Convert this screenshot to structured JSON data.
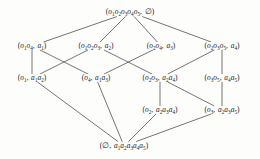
{
  "figure": {
    "type": "hasse-diagram",
    "name": "concept-lattice",
    "width": 260,
    "height": 159,
    "background_color": "#fdfdfc",
    "line_color": "#3a3a3a",
    "text_color": "#1b1b1b"
  },
  "nodes": [
    {
      "id": "top",
      "level": 0,
      "x": 130,
      "y": 12,
      "extent": "o1o2o3o4o5",
      "intent": "",
      "label": "(o1o2o3o4o5, ∅)",
      "html": "<span class=\"paren\">(</span>o<sub>1</sub>o<sub>2</sub>o<sub>3</sub>o<sub>4</sub>o<sub>5</sub><span class=\"comma\">,</span> <span class=\"empty\">∅</span><span class=\"paren\">)</span>"
    },
    {
      "id": "n11",
      "level": 1,
      "x": 32,
      "y": 46,
      "extent": "o1o4",
      "intent": "a1",
      "label": "(o1o4, a1)",
      "html": "<span class=\"paren\">(</span>o<sub>1</sub>o<sub>4</sub><span class=\"comma\">,</span> a<sub>1</sub><span class=\"paren\">)</span>"
    },
    {
      "id": "n12",
      "level": 1,
      "x": 96,
      "y": 46,
      "extent": "o1o2o3",
      "intent": "a2",
      "label": "(o1o2o3, a2)",
      "html": "<span class=\"paren\">(</span>o<sub>1</sub>o<sub>2</sub>o<sub>3</sub><span class=\"comma\">,</span> a<sub>2</sub><span class=\"paren\">)</span>"
    },
    {
      "id": "n13",
      "level": 1,
      "x": 161,
      "y": 46,
      "extent": "o2o4",
      "intent": "a3",
      "label": "(o2o4, a3)",
      "html": "<span class=\"paren\">(</span>o<sub>2</sub>o<sub>4</sub><span class=\"comma\">,</span> a<sub>3</sub><span class=\"paren\">)</span>"
    },
    {
      "id": "n14",
      "level": 1,
      "x": 222,
      "y": 46,
      "extent": "o2o3o5",
      "intent": "a4",
      "label": "(o2o3o5, a4)",
      "html": "<span class=\"paren\">(</span>o<sub>2</sub>o<sub>3</sub>o<sub>5</sub><span class=\"comma\">,</span> a<sub>4</sub><span class=\"paren\">)</span>"
    },
    {
      "id": "n21",
      "level": 2,
      "x": 32,
      "y": 78,
      "extent": "o1",
      "intent": "a1a2",
      "label": "(o1, a1a2)",
      "html": "<span class=\"paren\">(</span>o<sub>1</sub><span class=\"comma\">,</span> a<sub>1</sub>a<sub>2</sub><span class=\"paren\">)</span>"
    },
    {
      "id": "n22",
      "level": 2,
      "x": 96,
      "y": 78,
      "extent": "o4",
      "intent": "a1a3",
      "label": "(o4, a1a3)",
      "html": "<span class=\"paren\">(</span>o<sub>4</sub><span class=\"comma\">,</span> a<sub>1</sub>a<sub>3</sub><span class=\"paren\">)</span>"
    },
    {
      "id": "n23",
      "level": 2,
      "x": 160,
      "y": 78,
      "extent": "o2o3",
      "intent": "a2a4",
      "label": "(o2o3, a2a4)",
      "html": "<span class=\"paren\">(</span>o<sub>2</sub>o<sub>3</sub><span class=\"comma\">,</span> a<sub>2</sub>a<sub>4</sub><span class=\"paren\">)</span>"
    },
    {
      "id": "n24",
      "level": 2,
      "x": 222,
      "y": 78,
      "extent": "o3o5",
      "intent": "a4a5",
      "label": "(o3o5, a4a5)",
      "html": "<span class=\"paren\">(</span>o<sub>3</sub>o<sub>5</sub><span class=\"comma\">,</span> a<sub>4</sub>a<sub>5</sub><span class=\"paren\">)</span>"
    },
    {
      "id": "n31",
      "level": 3,
      "x": 160,
      "y": 110,
      "extent": "o2",
      "intent": "a2a3a4",
      "label": "(o2, a2a3a4)",
      "html": "<span class=\"paren\">(</span>o<sub>2</sub><span class=\"comma\">,</span> a<sub>2</sub>a<sub>3</sub>a<sub>4</sub><span class=\"paren\">)</span>"
    },
    {
      "id": "n32",
      "level": 3,
      "x": 222,
      "y": 110,
      "extent": "o3",
      "intent": "a2a3a5",
      "label": "(o3, a2a3a5)",
      "html": "<span class=\"paren\">(</span>o<sub>3</sub><span class=\"comma\">,</span> a<sub>2</sub>a<sub>3</sub>a<sub>5</sub><span class=\"paren\">)</span>"
    },
    {
      "id": "bottom",
      "level": 4,
      "x": 124,
      "y": 146,
      "extent": "",
      "intent": "a1a2a3a4a5",
      "label": "(∅, a1a2a3a4a5)",
      "html": "<span class=\"paren\">(</span><span class=\"empty\">∅</span><span class=\"comma\">,</span> a<sub>1</sub>a<sub>2</sub>a<sub>3</sub>a<sub>4</sub>a<sub>5</sub><span class=\"paren\">)</span>"
    }
  ],
  "edges": [
    {
      "from": "top",
      "to": "n11"
    },
    {
      "from": "top",
      "to": "n12"
    },
    {
      "from": "top",
      "to": "n13"
    },
    {
      "from": "top",
      "to": "n14"
    },
    {
      "from": "n11",
      "to": "n21"
    },
    {
      "from": "n11",
      "to": "n22"
    },
    {
      "from": "n12",
      "to": "n21"
    },
    {
      "from": "n12",
      "to": "n23"
    },
    {
      "from": "n13",
      "to": "n22"
    },
    {
      "from": "n14",
      "to": "n23"
    },
    {
      "from": "n14",
      "to": "n24"
    },
    {
      "from": "n23",
      "to": "n31"
    },
    {
      "from": "n23",
      "to": "n32"
    },
    {
      "from": "n24",
      "to": "n32"
    },
    {
      "from": "n21",
      "to": "bottom"
    },
    {
      "from": "n22",
      "to": "bottom"
    },
    {
      "from": "n31",
      "to": "bottom"
    },
    {
      "from": "n32",
      "to": "bottom"
    }
  ]
}
